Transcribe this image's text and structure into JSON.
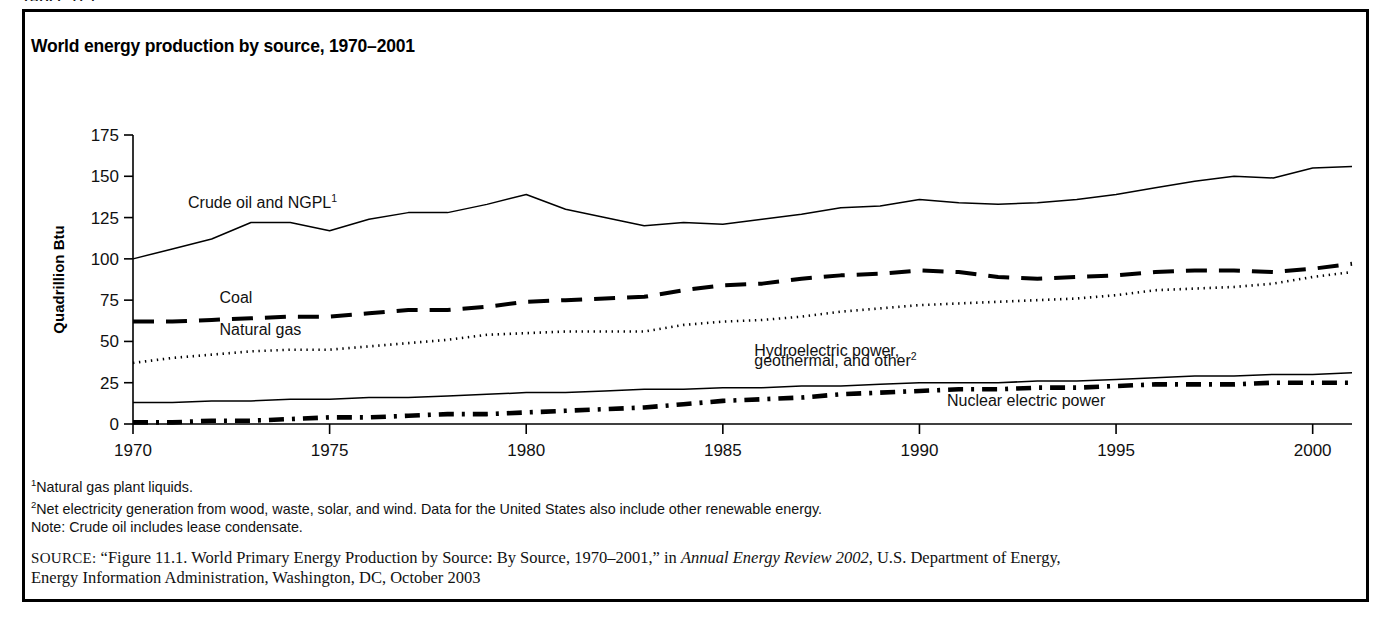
{
  "top_caption_fragment": "TABLE 11.1",
  "figure": {
    "title": "World energy production by source, 1970–2001",
    "notes": [
      {
        "marker": "1",
        "text": "Natural gas plant liquids."
      },
      {
        "marker": "2",
        "text": "Net electricity generation from wood, waste, solar, and wind.  Data for the United States also include other renewable energy."
      },
      {
        "marker": "",
        "text": "Note: Crude oil includes lease condensate."
      }
    ],
    "source": {
      "label": "SOURCE:",
      "line1_a": "“Figure 11.1. World Primary Energy Production by Source: By Source, 1970–2001,” in ",
      "line1_italic": "Annual Energy Review 2002",
      "line1_b": ", U.S. Department of Energy,",
      "line2": "Energy Information Administration, Washington, DC, October 2003"
    }
  },
  "chart_data": {
    "type": "line",
    "title": "World energy production by source, 1970–2001",
    "xlabel": "",
    "ylabel": "Quadrillion Btu",
    "xlim": [
      1970,
      2001
    ],
    "ylim": [
      0,
      175
    ],
    "yticks": [
      0,
      25,
      50,
      75,
      100,
      125,
      150,
      175
    ],
    "xticks": [
      1970,
      1975,
      1980,
      1985,
      1990,
      1995,
      2000
    ],
    "grid": false,
    "legend": "inline-labels",
    "x": [
      1970,
      1971,
      1972,
      1973,
      1974,
      1975,
      1976,
      1977,
      1978,
      1979,
      1980,
      1981,
      1982,
      1983,
      1984,
      1985,
      1986,
      1987,
      1988,
      1989,
      1990,
      1991,
      1992,
      1993,
      1994,
      1995,
      1996,
      1997,
      1998,
      1999,
      2000,
      2001
    ],
    "series": [
      {
        "name": "Crude oil and NGPL",
        "footnote": "1",
        "style": "solid-thin",
        "label_x": 1971.4,
        "label_y": 131,
        "values": [
          100,
          106,
          112,
          122,
          122,
          117,
          124,
          128,
          128,
          133,
          139,
          130,
          125,
          120,
          122,
          121,
          124,
          127,
          131,
          132,
          136,
          134,
          133,
          134,
          136,
          139,
          143,
          147,
          150,
          149,
          155,
          156
        ]
      },
      {
        "name": "Coal",
        "style": "dashed-thick",
        "label_x": 1972.2,
        "label_y": 73,
        "values": [
          62,
          62,
          63,
          64,
          65,
          65,
          67,
          69,
          69,
          71,
          74,
          75,
          76,
          77,
          81,
          84,
          85,
          88,
          90,
          91,
          93,
          92,
          89,
          88,
          89,
          90,
          92,
          93,
          93,
          92,
          94,
          97
        ]
      },
      {
        "name": "Natural gas",
        "style": "dotted",
        "label_x": 1972.2,
        "label_y": 54,
        "values": [
          37,
          40,
          42,
          44,
          45,
          45,
          47,
          49,
          51,
          54,
          55,
          56,
          56,
          56,
          60,
          62,
          63,
          65,
          68,
          70,
          72,
          73,
          74,
          75,
          76,
          78,
          81,
          82,
          83,
          85,
          89,
          92
        ]
      },
      {
        "name": "Hydroelectric power, geothermal, and other",
        "footnote": "2",
        "style": "solid-thin",
        "label_x": 1985.8,
        "label_y": 41,
        "label_line2_y": 35,
        "values": [
          13,
          13,
          14,
          14,
          15,
          15,
          16,
          16,
          17,
          18,
          19,
          19,
          20,
          21,
          21,
          22,
          22,
          23,
          23,
          24,
          25,
          25,
          25,
          26,
          26,
          27,
          28,
          29,
          29,
          30,
          30,
          31
        ]
      },
      {
        "name": "Nuclear electric power",
        "style": "dashdot-thick",
        "label_x": 1990.7,
        "label_y": 11,
        "values": [
          1,
          1,
          2,
          2,
          3,
          4,
          4,
          5,
          6,
          6,
          7,
          8,
          9,
          10,
          12,
          14,
          15,
          16,
          18,
          19,
          20,
          21,
          21,
          22,
          22,
          23,
          24,
          24,
          24,
          25,
          25,
          25
        ]
      }
    ]
  }
}
